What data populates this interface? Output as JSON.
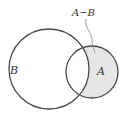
{
  "diagram": {
    "type": "venn",
    "sets": [
      {
        "id": "B",
        "label": "B",
        "cx": 49,
        "cy": 69,
        "r": 40
      },
      {
        "id": "A",
        "label": "A",
        "cx": 92,
        "cy": 72,
        "r": 26
      }
    ],
    "shaded_region": {
      "label": "A−B",
      "fill": "#e6e6e6"
    },
    "colors": {
      "stroke": "#4a4a4a",
      "shade": "#e6e6e6",
      "text": "#333333",
      "leader": "#888888"
    }
  }
}
